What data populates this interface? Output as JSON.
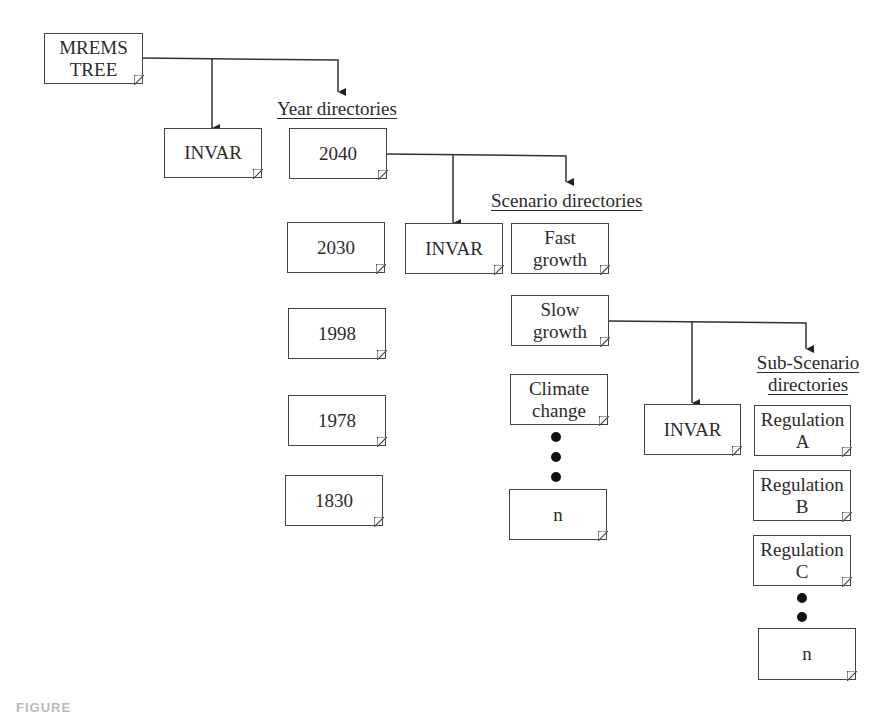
{
  "diagram": {
    "type": "directory tree",
    "root": {
      "label_lines": [
        "MREMS",
        "TREE"
      ]
    },
    "level1": {
      "invar": {
        "label": "INVAR"
      },
      "heading": "Year directories",
      "years": [
        "2040",
        "2030",
        "1998",
        "1978",
        "1830"
      ]
    },
    "level2": {
      "parent": "2040",
      "invar": {
        "label": "INVAR"
      },
      "heading": "Scenario directories",
      "scenarios": [
        {
          "lines": [
            "Fast",
            "growth"
          ]
        },
        {
          "lines": [
            "Slow",
            "growth"
          ]
        },
        {
          "lines": [
            "Climate",
            "change"
          ]
        },
        {
          "lines": [
            "n"
          ]
        }
      ]
    },
    "level3": {
      "parent": "Slow growth",
      "invar": {
        "label": "INVAR"
      },
      "heading_lines": [
        "Sub-Scenario",
        "directories"
      ],
      "subscenarios": [
        {
          "lines": [
            "Regulation",
            "A"
          ]
        },
        {
          "lines": [
            "Regulation",
            "B"
          ]
        },
        {
          "lines": [
            "Regulation",
            "C"
          ]
        },
        {
          "lines": [
            "n"
          ]
        }
      ]
    },
    "ellipsis_icon": "vertical-dots",
    "caption": "FIGURE"
  }
}
